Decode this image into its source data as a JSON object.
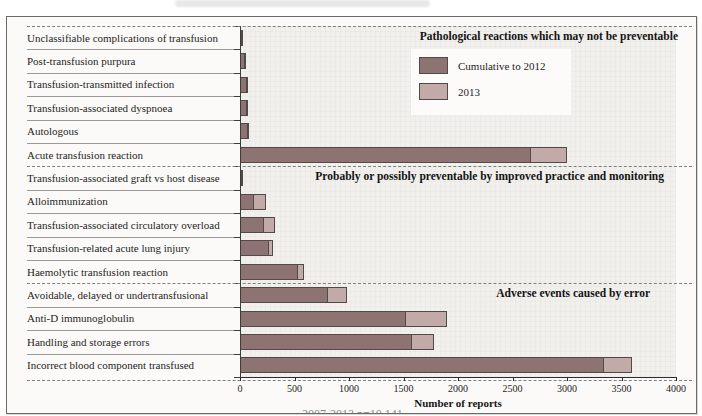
{
  "figure": {
    "caption_partial": "2007-2013 n=10,141"
  },
  "chart_data": {
    "type": "bar",
    "orientation": "horizontal",
    "stacked": true,
    "title": "",
    "xlabel": "Number of reports",
    "xlim": [
      0,
      4000
    ],
    "x_ticks": [
      0,
      500,
      1000,
      1500,
      2000,
      2500,
      3000,
      3500,
      4000
    ],
    "grid": false,
    "legend_position": "top-right-inside",
    "categories": [
      "Unclassifiable complications of transfusion",
      "Post-transfusion purpura",
      "Transfusion-transmitted infection",
      "Transfusion-associated dyspnoea",
      "Autologous",
      "Acute transfusion reaction",
      "Transfusion-associated graft vs host disease",
      "Alloimmunization",
      "Transfusion-associated circulatory overload",
      "Transfusion-related acute lung injury",
      "Haemolytic transfusion reaction",
      "Avoidable, delayed or undertransfusional",
      "Anti-D immunoglobulin",
      "Handling and storage errors",
      "Incorrect blood component transfused"
    ],
    "series": [
      {
        "name": "Cumulative to 2012",
        "color": "#8d7473",
        "values": [
          15,
          50,
          60,
          60,
          75,
          2670,
          12,
          130,
          220,
          270,
          530,
          810,
          1520,
          1580,
          3340
        ]
      },
      {
        "name": "2013",
        "color": "#c1aaa8",
        "values": [
          10,
          5,
          5,
          15,
          10,
          330,
          2,
          110,
          100,
          35,
          55,
          175,
          380,
          200,
          260
        ]
      }
    ],
    "sections": [
      {
        "label": "Pathological reactions which may not be preventable",
        "start_row": 0,
        "end_row": 5
      },
      {
        "label": "Probably or possibly preventable by improved practice and monitoring",
        "start_row": 6,
        "end_row": 10
      },
      {
        "label": "Adverse events caused by error",
        "start_row": 11,
        "end_row": 14
      }
    ]
  },
  "colors": {
    "cumulative_bar": "#8d7473",
    "year_2013_bar": "#c1aaa8",
    "bar_outline": "#524a48",
    "plot_background": "#f2f0ed",
    "dashed_line": "#808080",
    "figure_border": "#6a6a6a"
  }
}
